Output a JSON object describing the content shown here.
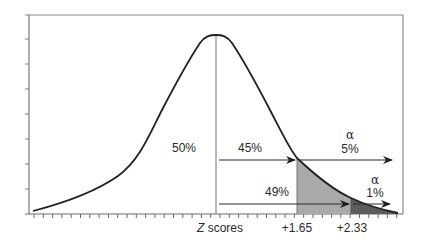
{
  "chart_data": {
    "type": "area",
    "title": "",
    "xlabel": "Z scores",
    "ylabel": "",
    "x_tick_labels": [
      "+1.65",
      "+2.33"
    ],
    "critical_values": [
      {
        "z": 1.65,
        "label": "+1.65",
        "alpha": "5%",
        "area_mean_to_z": "45%"
      },
      {
        "z": 2.33,
        "label": "+2.33",
        "alpha": "1%",
        "area_mean_to_z": "49%"
      }
    ],
    "annotations": {
      "left_half": "50%",
      "mean_to_1_65": "45%",
      "alpha_5_symbol": "α",
      "alpha_5_value": "5%",
      "mean_to_2_33": "49%",
      "alpha_1_symbol": "α",
      "alpha_1_value": "1%"
    },
    "regions": [
      {
        "from": 1.65,
        "to": 2.33,
        "fill": "#a9a9a9"
      },
      {
        "from": 2.33,
        "to": "tail",
        "fill": "#5a5a5a"
      }
    ],
    "grid": false,
    "legend": null
  },
  "labels": {
    "xaxis_z": "Z",
    "xaxis_rest": " scores",
    "tick_165": "+1.65",
    "tick_233": "+2.33",
    "pct_50": "50%",
    "pct_45": "45%",
    "alpha_a": "α",
    "pct_5": "5%",
    "pct_49": "49%",
    "alpha_b": "α",
    "pct_1": "1%"
  },
  "colors": {
    "frame": "#7a7a7a",
    "curve": "#222222",
    "light_shade": "#a9a9a9",
    "dark_shade": "#5a5a5a",
    "arrow": "#2a2a2a"
  }
}
